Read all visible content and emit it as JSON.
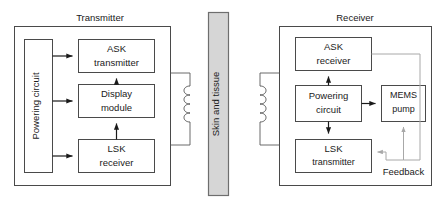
{
  "diagram": {
    "colors": {
      "tissue_fill": "#d6d6d6",
      "tissue_stroke": "#6e6e6e",
      "box_stroke": "#4a4a4a",
      "wire": "#1a1a1a",
      "feedback_wire": "#a8a8a8",
      "background": "#ffffff"
    },
    "transmitter": {
      "title": "Transmitter",
      "blocks": {
        "powering_circuit": "Powering circuit",
        "ask_transmitter_line1": "ASK",
        "ask_transmitter_line2": "transmitter",
        "display_module_line1": "Display",
        "display_module_line2": "module",
        "lsk_receiver_line1": "LSK",
        "lsk_receiver_line2": "receiver"
      },
      "coil_label": "primary-coil"
    },
    "barrier": {
      "label": "Skin and tissue"
    },
    "receiver": {
      "title": "Receiver",
      "blocks": {
        "ask_receiver_line1": "ASK",
        "ask_receiver_line2": "receiver",
        "powering_circuit_line1": "Powering",
        "powering_circuit_line2": "circuit",
        "mems_pump_line1": "MEMS",
        "mems_pump_line2": "pump",
        "lsk_transmitter_line1": "LSK",
        "lsk_transmitter_line2": "transmitter"
      },
      "feedback_label": "Feedback",
      "coil_label": "secondary-coil"
    }
  }
}
